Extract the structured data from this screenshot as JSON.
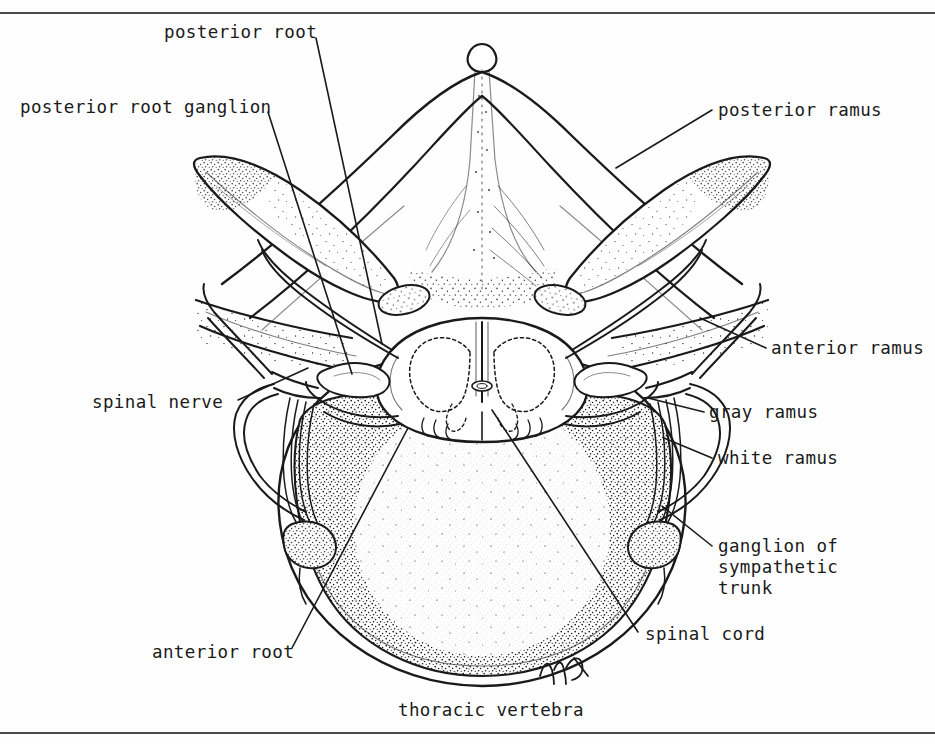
{
  "figure": {
    "title_caption": "thoracic vertebra",
    "artist_signature": "mh",
    "ink_color": "#1a1a1a",
    "paper_color": "#fefefe",
    "rule_color": "#4a4a4a"
  },
  "labels": {
    "posterior_root": "posterior root",
    "posterior_root_ganglion": "posterior root ganglion",
    "posterior_ramus": "posterior ramus",
    "anterior_ramus": "anterior ramus",
    "gray_ramus": "gray ramus",
    "white_ramus": "white ramus",
    "ganglion_of_sympathetic_trunk_line1": "ganglion of",
    "ganglion_of_sympathetic_trunk_line2": "sympathetic",
    "ganglion_of_sympathetic_trunk_line3": "trunk",
    "spinal_nerve": "spinal nerve",
    "spinal_cord": "spinal cord",
    "anterior_root": "anterior root",
    "thoracic_vertebra": "thoracic vertebra"
  }
}
